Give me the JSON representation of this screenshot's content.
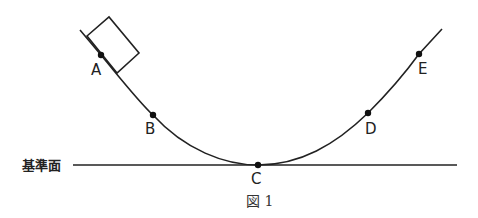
{
  "figure": {
    "caption": "図 1",
    "reference_label": "基準面",
    "points": [
      {
        "label": "A",
        "x": 101,
        "y": 55
      },
      {
        "label": "B",
        "x": 153,
        "y": 115
      },
      {
        "label": "C",
        "x": 258,
        "y": 165
      },
      {
        "label": "D",
        "x": 368,
        "y": 113
      },
      {
        "label": "E",
        "x": 419,
        "y": 54
      }
    ],
    "object": "block-on-slope",
    "colors": {
      "line": "#222222",
      "background": "#ffffff"
    }
  }
}
